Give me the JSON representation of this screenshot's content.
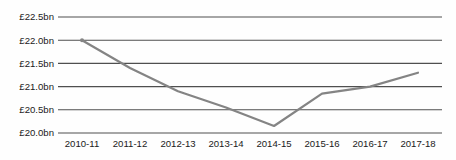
{
  "chart_data": {
    "type": "line",
    "title": "",
    "xlabel": "",
    "ylabel": "",
    "categories": [
      "2010-11",
      "2011-12",
      "2012-13",
      "2013-14",
      "2014-15",
      "2015-16",
      "2016-17",
      "2017-18"
    ],
    "series": [
      {
        "name": "spending",
        "values": [
          22.0,
          21.4,
          20.9,
          20.55,
          20.15,
          20.85,
          21.0,
          21.3
        ]
      }
    ],
    "ylim": [
      20.0,
      22.5
    ],
    "ytick_step": 0.5,
    "ytick_labels": [
      "£20.0bn",
      "£20.5bn",
      "£21.0bn",
      "£21.5bn",
      "£22.0bn",
      "£22.5bn"
    ],
    "grid": "horizontal",
    "legend": "none",
    "marker_on_first_point": true,
    "colors": {
      "line": "#848484",
      "gridline": "#4f4f4f",
      "tick_text": "#1a1a1a",
      "background": "#fefefe"
    }
  }
}
